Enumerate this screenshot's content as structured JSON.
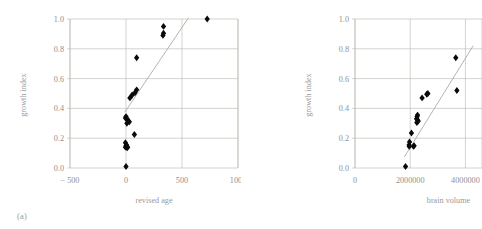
{
  "figure": {
    "background": "#ffffff",
    "text_color": "#909090",
    "grid_color": "#b9b6ad",
    "point_color": "#0a0a0a",
    "trend_color": "#a9a6a0"
  },
  "panels": [
    {
      "id": "a",
      "caption": "(a)",
      "chart_data": {
        "type": "scatter",
        "title": "",
        "xlabel": "revised age",
        "ylabel": "growth index",
        "xlim": [
          -500,
          1000
        ],
        "ylim": [
          0.0,
          1.0
        ],
        "xticks": [
          -500,
          0,
          500,
          1000
        ],
        "xtick_labels": [
          "− 500",
          "0",
          "500",
          "1000"
        ],
        "yticks": [
          0.0,
          0.2,
          0.4,
          0.6,
          0.8,
          1.0
        ],
        "ytick_labels": [
          "0.0",
          "0.2",
          "0.4",
          "0.6",
          "0.8",
          "1.0"
        ],
        "grid": "horizontal-and-vertical",
        "legend": "none",
        "points": [
          {
            "x": 0,
            "y": 0.01
          },
          {
            "x": -5,
            "y": 0.14
          },
          {
            "x": 0,
            "y": 0.15
          },
          {
            "x": 5,
            "y": 0.155
          },
          {
            "x": 10,
            "y": 0.135
          },
          {
            "x": 15,
            "y": 0.14
          },
          {
            "x": -5,
            "y": 0.17
          },
          {
            "x": 75,
            "y": 0.225
          },
          {
            "x": -5,
            "y": 0.335
          },
          {
            "x": 0,
            "y": 0.345
          },
          {
            "x": 10,
            "y": 0.33
          },
          {
            "x": 20,
            "y": 0.315
          },
          {
            "x": 30,
            "y": 0.31
          },
          {
            "x": 8,
            "y": 0.3
          },
          {
            "x": 35,
            "y": 0.47
          },
          {
            "x": 55,
            "y": 0.49
          },
          {
            "x": 80,
            "y": 0.505
          },
          {
            "x": 95,
            "y": 0.525
          },
          {
            "x": 95,
            "y": 0.74
          },
          {
            "x": 330,
            "y": 0.89
          },
          {
            "x": 335,
            "y": 0.905
          },
          {
            "x": 335,
            "y": 0.95
          },
          {
            "x": 725,
            "y": 1.0
          }
        ],
        "trendline": {
          "x1": -10,
          "y1": 0.375,
          "x2": 555,
          "y2": 1.005
        }
      }
    },
    {
      "id": "b",
      "caption": "(b)",
      "chart_data": {
        "type": "scatter",
        "title": "",
        "xlabel": "brain volume",
        "ylabel": "growth index",
        "xlim": [
          0,
          4600000
        ],
        "ylim": [
          0.0,
          1.0
        ],
        "xticks": [
          0,
          2000000,
          4000000
        ],
        "xtick_labels": [
          "0",
          "2000000",
          "4000000"
        ],
        "yticks": [
          0.0,
          0.2,
          0.4,
          0.6,
          0.8,
          1.0
        ],
        "ytick_labels": [
          "0.0",
          "0.2",
          "0.4",
          "0.6",
          "0.8",
          "1.0"
        ],
        "grid": "horizontal-and-vertical",
        "legend": "none",
        "points": [
          {
            "x": 1830000,
            "y": 0.01
          },
          {
            "x": 1960000,
            "y": 0.155
          },
          {
            "x": 1975000,
            "y": 0.175
          },
          {
            "x": 1965000,
            "y": 0.145
          },
          {
            "x": 2120000,
            "y": 0.145
          },
          {
            "x": 2140000,
            "y": 0.15
          },
          {
            "x": 2045000,
            "y": 0.235
          },
          {
            "x": 2240000,
            "y": 0.305
          },
          {
            "x": 2255000,
            "y": 0.325
          },
          {
            "x": 2250000,
            "y": 0.345
          },
          {
            "x": 2265000,
            "y": 0.355
          },
          {
            "x": 2230000,
            "y": 0.33
          },
          {
            "x": 2290000,
            "y": 0.315
          },
          {
            "x": 2430000,
            "y": 0.47
          },
          {
            "x": 2600000,
            "y": 0.495
          },
          {
            "x": 2640000,
            "y": 0.5
          },
          {
            "x": 3650000,
            "y": 0.74
          },
          {
            "x": 3690000,
            "y": 0.52
          }
        ],
        "trendline": {
          "x1": 1790000,
          "y1": 0.075,
          "x2": 4280000,
          "y2": 0.82
        }
      }
    }
  ]
}
